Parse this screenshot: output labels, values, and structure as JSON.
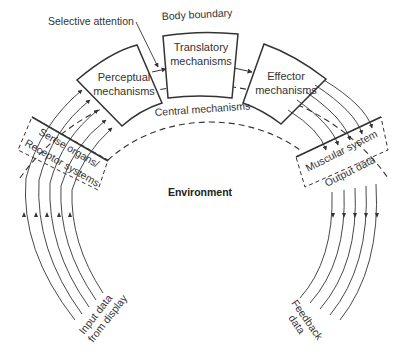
{
  "diagram": {
    "labels": {
      "selective_attention": "Selective attention",
      "body_boundary": "Body boundary",
      "central_mechanisms": "Central mechanisms",
      "environment": "Environment",
      "sense_organs_line1": "Sense organs/",
      "sense_organs_line2": "Receptor systems",
      "muscular_system": "Muscular system",
      "output_data": "Output data",
      "input_data_line1": "Input data",
      "input_data_line2": "from display",
      "feedback_line1": "Feedback",
      "feedback_line2": "data"
    },
    "boxes": [
      {
        "id": "perceptual",
        "line1": "Perceptual",
        "line2": "mechanisms"
      },
      {
        "id": "translatory",
        "line1": "Translatory",
        "line2": "mechanisms"
      },
      {
        "id": "effector",
        "line1": "Effector",
        "line2": "mechanisms"
      }
    ],
    "colors": {
      "stroke": "#333333",
      "text": "#333333",
      "background": "#ffffff"
    }
  }
}
